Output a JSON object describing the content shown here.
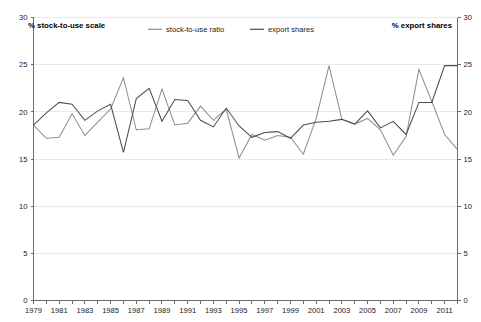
{
  "chart_data": {
    "type": "line",
    "title": "",
    "subtitle": "",
    "xlabel": "",
    "ylabel_left": "% stock-to-use scale",
    "ylabel_right": "% export shares",
    "ylim": [
      0,
      30
    ],
    "ylim_right": [
      0,
      30
    ],
    "xlim": [
      1979,
      2012
    ],
    "grid": true,
    "legend_position": "top-center",
    "y_ticks": [
      0,
      5,
      10,
      15,
      20,
      25,
      30
    ],
    "y_ticks_right": [
      0,
      5,
      10,
      15,
      20,
      25,
      30
    ],
    "x_ticks": [
      1979,
      1981,
      1983,
      1985,
      1987,
      1989,
      1991,
      1993,
      1995,
      1997,
      1999,
      2001,
      2003,
      2005,
      2007,
      2009,
      2011
    ],
    "x": [
      1979,
      1980,
      1981,
      1982,
      1983,
      1984,
      1985,
      1986,
      1987,
      1988,
      1989,
      1990,
      1991,
      1992,
      1993,
      1994,
      1995,
      1996,
      1997,
      1998,
      1999,
      2000,
      2001,
      2002,
      2003,
      2004,
      2005,
      2006,
      2007,
      2008,
      2009,
      2010,
      2011,
      2012
    ],
    "series": [
      {
        "name": "stock-to-use ratio",
        "color": "#8f8f8f",
        "values": [
          18.6,
          17.2,
          17.3,
          19.8,
          17.5,
          18.9,
          20.3,
          23.6,
          18.1,
          18.2,
          22.4,
          18.6,
          18.8,
          20.6,
          19.1,
          20.3,
          15.1,
          17.6,
          17.0,
          17.5,
          17.3,
          15.5,
          19.3,
          24.9,
          19.2,
          18.7,
          19.3,
          18.1,
          15.4,
          17.4,
          24.5,
          21.1,
          17.6,
          16.0
        ]
      },
      {
        "name": "export shares",
        "color": "#4d4d4d",
        "values": [
          18.6,
          19.9,
          21.0,
          20.8,
          19.1,
          20.1,
          20.8,
          15.7,
          21.4,
          22.5,
          19.0,
          21.3,
          21.2,
          19.1,
          18.4,
          20.4,
          18.5,
          17.3,
          17.8,
          17.9,
          17.2,
          18.6,
          18.9,
          19.0,
          19.2,
          18.7,
          20.1,
          18.3,
          19.0,
          17.6,
          21.0,
          21.0,
          24.9,
          24.9
        ]
      }
    ]
  },
  "axis_captions": {
    "left": "% stock-to-use scale",
    "right": "% export shares"
  },
  "legend": {
    "items": [
      {
        "label": "stock-to-use ratio",
        "color": "#8f8f8f"
      },
      {
        "label": "export shares",
        "color": "#4d4d4d"
      }
    ]
  },
  "colors": {
    "stock_to_use": "#8f8f8f",
    "export_shares": "#4d4d4d",
    "axis": "#6b6b6b",
    "grid": "#e9e9e9",
    "background": "#ffffff"
  }
}
